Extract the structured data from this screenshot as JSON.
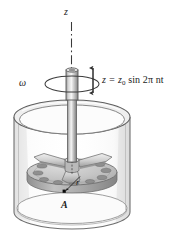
{
  "figure": {
    "background_color": "#ffffff",
    "labels": {
      "axis_label": "z",
      "angular_velocity_label": "ω",
      "equation_prefix": "z = z",
      "equation_subscript": "0",
      "equation_body": " sin 2π nt",
      "equation_full": "z = z0 sin 2π nt",
      "radius_label": "r",
      "point_label": "A"
    },
    "colors": {
      "outline": "#4c4c4c",
      "shaft_light": "#f2f2f2",
      "shaft_mid": "#9a9a9a",
      "shaft_dark": "#6e6e6e",
      "disk_face": "#c9c9c9",
      "disk_edge": "#a6a6a6",
      "hole_fill": "#8c8c8c",
      "glass_tint": "#f4f4f4",
      "glass_stroke": "#7d7d7d",
      "point_marker": "#0a0a0a",
      "text": "#1b1b1b"
    },
    "elements": {
      "vertical_axis": "dash-dot vertical centerline",
      "shaft": "vertical rotating cylindrical shaft",
      "rotation_ellipse": "horizontal ellipse indicating spin direction",
      "oscillation_arrow": "vertical double-headed arrow for z oscillation",
      "container": "transparent cylindrical vessel",
      "disk": "perforated circular disk with three-arm spider hub",
      "hole_count": 12,
      "spider_arms": 3,
      "radius_arrow": "leader arrow from disk center to point A",
      "point_marker": "black square dot at point A"
    }
  }
}
